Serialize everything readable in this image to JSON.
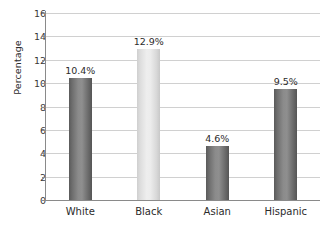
{
  "chart_data": {
    "type": "bar",
    "title": "",
    "xlabel": "",
    "ylabel": "Percentage",
    "categories": [
      "White",
      "Black",
      "Asian",
      "Hispanic"
    ],
    "values": [
      10.4,
      12.9,
      4.6,
      9.5
    ],
    "value_labels": [
      "10.4%",
      "12.9%",
      "4.6%",
      "9.5%"
    ],
    "ylim": [
      0,
      16
    ],
    "yticks": [
      0,
      2,
      4,
      6,
      8,
      10,
      12,
      14,
      16
    ],
    "ytick_labels": [
      "0",
      "2",
      "4",
      "6",
      "8",
      "10",
      "12",
      "14",
      "16"
    ],
    "grid": true,
    "legend": "none",
    "bar_colors": [
      "#7f7f7f",
      "#e4e4e4",
      "#7f7f7f",
      "#7f7f7f"
    ],
    "gridline_color": "#d0d0d0",
    "axis_color": "#8a8a8a",
    "text_color": "#2b2b2b"
  }
}
